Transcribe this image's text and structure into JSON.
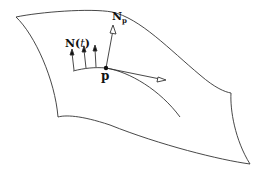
{
  "diagram": {
    "labels": {
      "normal_t": "N(t)",
      "normal_t_base": "N(",
      "normal_t_param": "t",
      "normal_t_close": ")",
      "normal_p": "N",
      "normal_p_sub": "p",
      "point": "p"
    },
    "elements": [
      {
        "type": "surface",
        "description": "curved sheet"
      },
      {
        "type": "curve",
        "description": "curve on surface passing through p"
      },
      {
        "type": "vectors",
        "description": "normal vectors N(t) along curve",
        "count": 3
      },
      {
        "type": "vector",
        "description": "normal at p, N_p"
      },
      {
        "type": "vector",
        "description": "tangent vector at p"
      },
      {
        "type": "point",
        "description": "p"
      }
    ],
    "colors": {
      "stroke": "#222222",
      "background": "#ffffff"
    }
  }
}
